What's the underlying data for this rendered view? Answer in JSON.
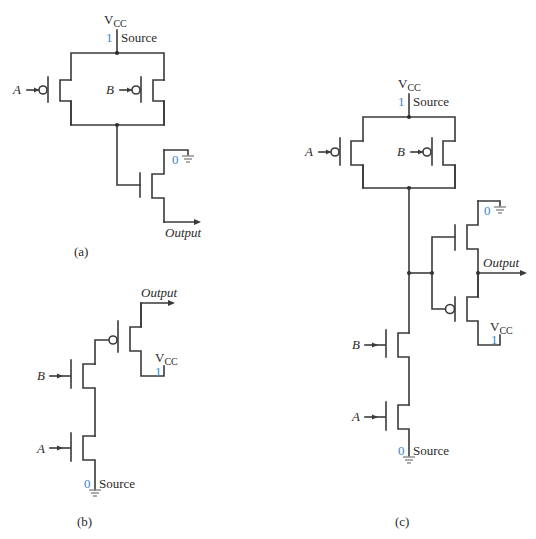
{
  "figure": {
    "panels": [
      {
        "caption": "(a)",
        "supply_label": "V",
        "supply_sub": "CC",
        "supply_logic": "1",
        "source_label": "Source",
        "ground_logic": "0",
        "input_a": "A",
        "input_b": "B",
        "output_label": "Output"
      },
      {
        "caption": "(b)",
        "supply_label": "V",
        "supply_sub": "CC",
        "supply_logic": "1",
        "source_label": "Source",
        "ground_logic": "0",
        "input_a": "A",
        "input_b": "B",
        "output_label": "Output"
      },
      {
        "caption": "(c)",
        "supply_label": "V",
        "supply_sub": "CC",
        "supply_logic": "1",
        "source_label": "Source",
        "inv_supply_label": "V",
        "inv_supply_sub": "CC",
        "inv_supply_logic": "1",
        "inv_ground_logic": "0",
        "ground_logic": "0",
        "input_a": "A",
        "input_b": "B",
        "output_label": "Output"
      }
    ]
  },
  "colors": {
    "wire": "#3a3a3a",
    "logic_value": "#3d86c6",
    "ground": "#8a8a8a"
  }
}
